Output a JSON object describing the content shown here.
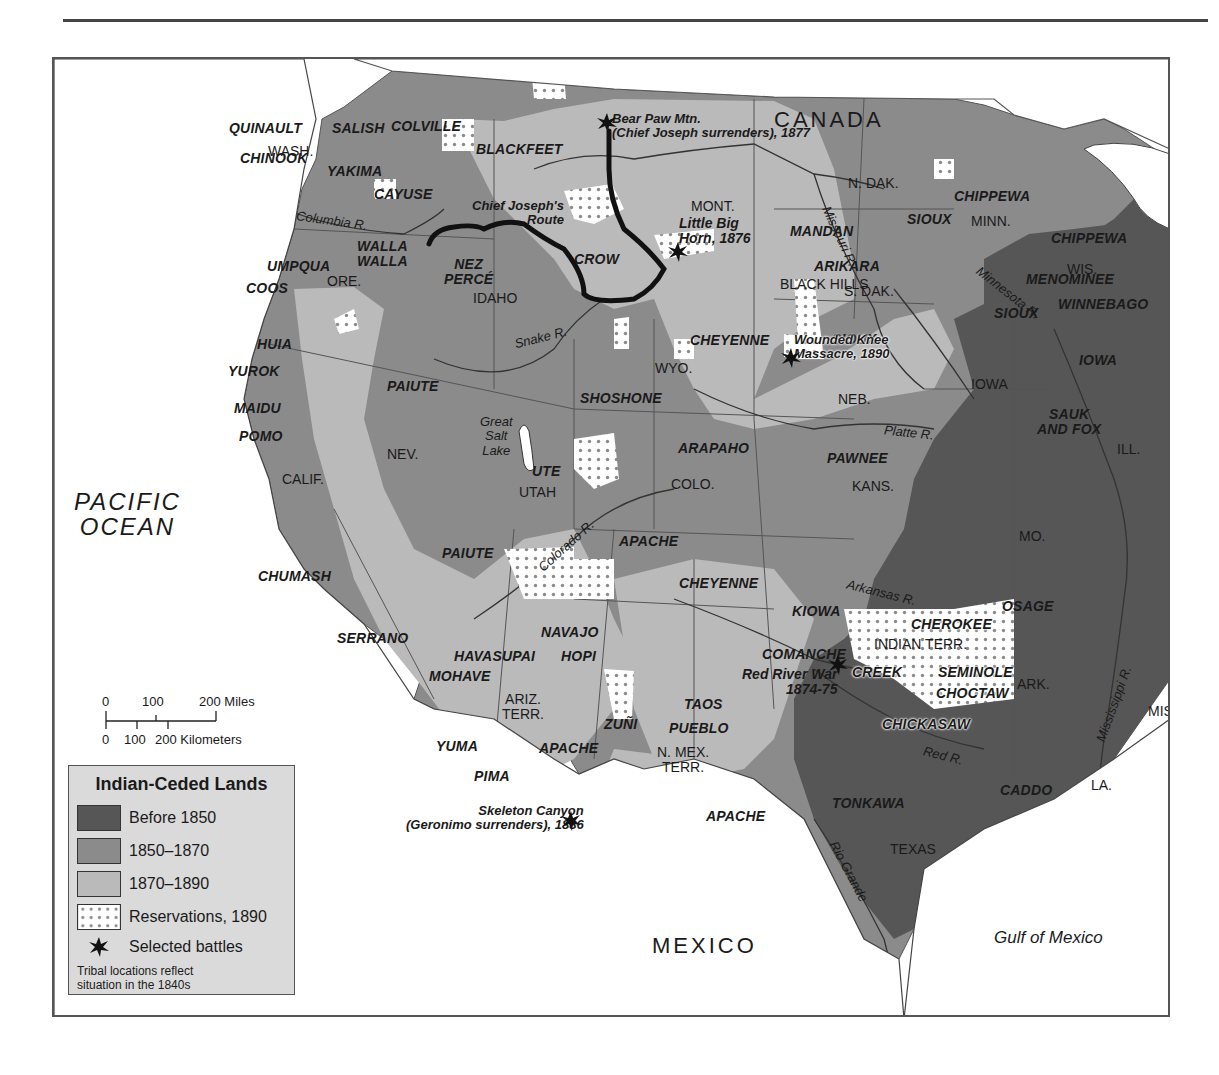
{
  "map": {
    "title": "Indian-Ceded Lands",
    "countries": {
      "canada": "CANADA",
      "mexico": "MEXICO"
    },
    "water_bodies": {
      "pacific": "PACIFIC\nOCEAN",
      "pacific_line1": "PACIFIC",
      "pacific_line2": "OCEAN",
      "gulf": "Gulf of Mexico",
      "great_salt_lake_1": "Great",
      "great_salt_lake_2": "Salt",
      "great_salt_lake_3": "Lake"
    },
    "states": {
      "wash": "WASH.",
      "ore": "ORE.",
      "idaho": "IDAHO",
      "mont": "MONT.",
      "wyo": "WYO.",
      "calif": "CALIF.",
      "nev": "NEV.",
      "utah": "UTAH",
      "colo": "COLO.",
      "ariz_1": "ARIZ.",
      "ariz_2": "TERR.",
      "nmex_1": "N. MEX.",
      "nmex_2": "TERR.",
      "ndak": "N. DAK.",
      "sdak": "S. DAK.",
      "neb": "NEB.",
      "kans": "KANS.",
      "minn": "MINN.",
      "iowa": "IOWA",
      "wis": "WIS.",
      "ill": "ILL.",
      "mo": "MO.",
      "ark": "ARK.",
      "la": "LA.",
      "miss": "MISS.",
      "texas": "TEXAS",
      "indian_terr": "INDIAN TERR.",
      "black_hills": "BLACK HILLS"
    },
    "rivers": {
      "columbia": "Columbia R.",
      "snake": "Snake R.",
      "missouri": "Missouri R.",
      "minnesota": "Minnesota R.",
      "platte": "Platte R.",
      "colorado": "Colorado R.",
      "arkansas": "Arkansas R.",
      "red": "Red R.",
      "rio_grande": "Rio Grande",
      "mississippi": "Mississippi R."
    },
    "tribes": {
      "quinault": "QUINAULT",
      "salish": "SALISH",
      "colville": "COLVILLE",
      "chinook": "CHINOOK",
      "yakima": "YAKIMA",
      "cayuse": "CAYUSE",
      "blackfeet": "BLACKFEET",
      "walla_1": "WALLA",
      "walla_2": "WALLA",
      "umpqua": "UMPQUA",
      "coos": "COOS",
      "nez_1": "NEZ",
      "nez_2": "PERCÉ",
      "crow": "CROW",
      "huia": "HUIA",
      "yurok": "YUROK",
      "maidu": "MAIDU",
      "pomo": "POMO",
      "paiute_n": "PAIUTE",
      "paiute_s": "PAIUTE",
      "shoshone": "SHOSHONE",
      "cheyenne_n": "CHEYENNE",
      "cheyenne_s": "CHEYENNE",
      "ute": "UTE",
      "arapaho": "ARAPAHO",
      "pawnee": "PAWNEE",
      "mandan": "MANDAN",
      "arikara": "ARIKARA",
      "sioux_1": "SIOUX",
      "sioux_2": "SIOUX",
      "sioux_3": "SIOUX",
      "chippewa_1": "CHIPPEWA",
      "chippewa_2": "CHIPPEWA",
      "menominee": "MENOMINEE",
      "winnebago": "WINNEBAGO",
      "iowa": "IOWA",
      "sauk_1": "SAUK",
      "sauk_2": "AND FOX",
      "chumash": "CHUMASH",
      "serrano": "SERRANO",
      "mohave": "MOHAVE",
      "havasupai": "HAVASUPAI",
      "navajo": "NAVAJO",
      "hopi": "HOPI",
      "apache_1": "APACHE",
      "apache_2": "APACHE",
      "apache_3": "APACHE",
      "yuma": "YUMA",
      "pima": "PIMA",
      "zuni": "ZUÑI",
      "taos": "TAOS",
      "pueblo": "PUEBLO",
      "kiowa": "KIOWA",
      "comanche": "COMANCHE",
      "osage": "OSAGE",
      "cherokee": "CHEROKEE",
      "creek": "CREEK",
      "seminole": "SEMINOLE",
      "choctaw": "CHOCTAW",
      "chickasaw": "CHICKASAW",
      "tonkawa": "TONKAWA",
      "caddo": "CADDO"
    },
    "battles": {
      "bear_paw_1": "Bear Paw Mtn.",
      "bear_paw_2": "(Chief Joseph surrenders), 1877",
      "little_big_horn_1": "Little Big",
      "little_big_horn_2": "Horn, 1876",
      "wounded_knee_1": "Wounded Knee",
      "wounded_knee_2": "Massacre, 1890",
      "red_river_1": "Red River War",
      "red_river_2": "1874-75",
      "skeleton_1": "Skeleton Canyon",
      "skeleton_2": "(Geronimo surrenders), 1886"
    },
    "route": {
      "label_1": "Chief Joseph's",
      "label_2": "Route"
    }
  },
  "scale": {
    "miles_ticks": [
      "0",
      "100",
      "200 Miles"
    ],
    "km_ticks": [
      "0",
      "100",
      "200 Kilometers"
    ]
  },
  "legend": {
    "title": "Indian-Ceded Lands",
    "items": [
      {
        "label": "Before 1850",
        "color": "#565656"
      },
      {
        "label": "1850–1870",
        "color": "#8b8b8b"
      },
      {
        "label": "1870–1890",
        "color": "#bababa"
      },
      {
        "label": "Reservations, 1890",
        "color": "#ffffff"
      },
      {
        "label": "Selected battles",
        "icon": "battle-star-icon"
      }
    ],
    "note_1": "Tribal locations reflect",
    "note_2": "situation in the 1840s"
  },
  "colors": {
    "before_1850": "#565656",
    "c1850_1870": "#8b8b8b",
    "c1870_1890": "#bababa",
    "reservation": "#ffffff",
    "legend_bg": "#dadada",
    "route": "#111111"
  }
}
